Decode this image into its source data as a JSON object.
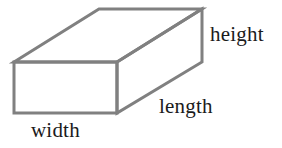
{
  "figure": {
    "name": "rectangular-prism-diagram",
    "background_color": "#ffffff",
    "line_color": "#808080",
    "line_width": 3,
    "text_color": "#1b1b1b",
    "font_size_px": 21
  },
  "labels": {
    "height": "height",
    "length": "length",
    "width": "width"
  },
  "shape": {
    "type": "cuboid",
    "projection": "oblique",
    "vertices": {
      "front_top_left": [
        14,
        62
      ],
      "front_top_right": [
        117,
        62
      ],
      "front_bottom_right": [
        117,
        113
      ],
      "front_bottom_left": [
        14,
        113
      ],
      "back_top_left": [
        99,
        9
      ],
      "back_top_right": [
        202,
        9
      ],
      "back_bottom_right": [
        202,
        62
      ]
    },
    "edges": [
      [
        "front_top_left",
        "front_top_right"
      ],
      [
        "front_top_right",
        "front_bottom_right"
      ],
      [
        "front_bottom_right",
        "front_bottom_left"
      ],
      [
        "front_bottom_left",
        "front_top_left"
      ],
      [
        "front_top_left",
        "back_top_left"
      ],
      [
        "back_top_left",
        "back_top_right"
      ],
      [
        "back_top_right",
        "back_bottom_right"
      ],
      [
        "back_bottom_right",
        "front_top_right"
      ],
      [
        "front_bottom_right",
        "back_bottom_right"
      ]
    ]
  }
}
